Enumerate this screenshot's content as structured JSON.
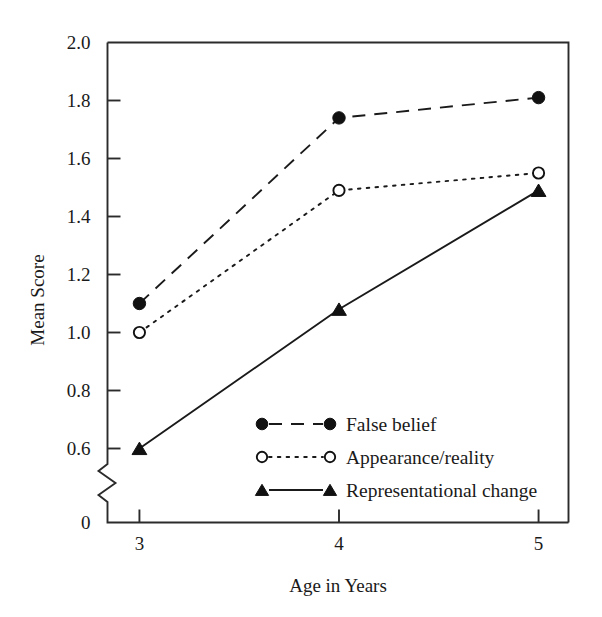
{
  "chart_data": {
    "type": "line",
    "title": "",
    "xlabel": "Age in Years",
    "ylabel": "Mean Score",
    "x": [
      3,
      4,
      5
    ],
    "categories": [
      "3",
      "4",
      "5"
    ],
    "xtick_labels": [
      "3",
      "4",
      "5"
    ],
    "ytick_labels": [
      "0",
      "0.6",
      "0.8",
      "1.0",
      "1.2",
      "1.4",
      "1.6",
      "1.8",
      "2.0"
    ],
    "ylim": [
      0.5,
      2.0
    ],
    "xlim": [
      2.84,
      5.15
    ],
    "y_axis_break": true,
    "y_axis_break_note": "zigzag break between 0 and 0.6",
    "grid": false,
    "legend_position": "inside-lower-right",
    "series": [
      {
        "name": "False belief",
        "values": [
          1.1,
          1.74,
          1.81
        ],
        "marker": "filled-circle",
        "linestyle": "dashed",
        "color": "#111111"
      },
      {
        "name": "Appearance/reality",
        "values": [
          1.0,
          1.49,
          1.55
        ],
        "marker": "open-circle",
        "linestyle": "dotted",
        "color": "#111111"
      },
      {
        "name": "Representational change",
        "values": [
          0.6,
          1.08,
          1.49
        ],
        "marker": "filled-triangle",
        "linestyle": "solid",
        "color": "#111111"
      }
    ]
  },
  "axes": {
    "y_title": "Mean Score",
    "x_title": "Age in Years",
    "y_ticks": [
      {
        "label": "2.0",
        "value": 2.0
      },
      {
        "label": "1.8",
        "value": 1.8
      },
      {
        "label": "1.6",
        "value": 1.6
      },
      {
        "label": "1.4",
        "value": 1.4
      },
      {
        "label": "1.2",
        "value": 1.2
      },
      {
        "label": "1.0",
        "value": 1.0
      },
      {
        "label": "0.8",
        "value": 0.8
      },
      {
        "label": "0.6",
        "value": 0.6
      },
      {
        "label": "0",
        "value": 0
      }
    ],
    "x_ticks": [
      {
        "label": "3",
        "value": 3
      },
      {
        "label": "4",
        "value": 4
      },
      {
        "label": "5",
        "value": 5
      }
    ]
  },
  "legend": {
    "entries": [
      {
        "label": "False belief",
        "marker": "filled-circle",
        "linestyle": "dashed"
      },
      {
        "label": "Appearance/reality",
        "marker": "open-circle",
        "linestyle": "dotted"
      },
      {
        "label": "Representational change",
        "marker": "filled-triangle",
        "linestyle": "solid"
      }
    ]
  },
  "colors": {
    "ink": "#1a1a1a",
    "axis": "#2b2b2b",
    "background": "#ffffff"
  }
}
